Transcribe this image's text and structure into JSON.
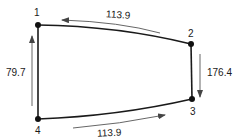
{
  "diagram": {
    "type": "closed-loop-graph",
    "nodes": [
      {
        "id": "1",
        "label": "1",
        "x": 38,
        "y": 25
      },
      {
        "id": "2",
        "label": "2",
        "x": 191,
        "y": 44
      },
      {
        "id": "3",
        "label": "3",
        "x": 192,
        "y": 99
      },
      {
        "id": "4",
        "label": "4",
        "x": 38,
        "y": 119
      }
    ],
    "edges": [
      {
        "from": "1",
        "to": "2",
        "label": "113.9",
        "arrow_direction": "toward-1"
      },
      {
        "from": "2",
        "to": "3",
        "label": "176.4",
        "arrow_direction": "toward-3"
      },
      {
        "from": "3",
        "to": "4",
        "label": "113.9",
        "arrow_direction": "toward-3"
      },
      {
        "from": "4",
        "to": "1",
        "label": "79.7",
        "arrow_direction": "toward-1"
      }
    ],
    "colors": {
      "line": "#1a1a1a",
      "arrow": "#555555",
      "background": "#ffffff"
    }
  }
}
